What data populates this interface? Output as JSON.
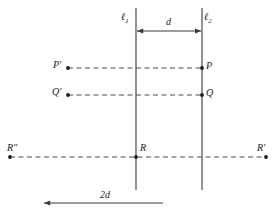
{
  "figure": {
    "width": 276,
    "height": 215,
    "background_color": "#ffffff",
    "stroke_color": "#3a3a3a",
    "dashed_color": "#4a4a4a",
    "text_color": "#1a1a1a"
  },
  "lines": {
    "l1": {
      "label": "ℓ",
      "subscript": "1",
      "x": 136,
      "y_top": 8,
      "y_bottom": 190,
      "label_x": 121,
      "label_y": 12
    },
    "l2": {
      "label": "ℓ",
      "subscript": "2",
      "x": 202,
      "y_top": 8,
      "y_bottom": 190,
      "label_x": 204,
      "label_y": 12
    }
  },
  "measures": {
    "d": {
      "label": "d",
      "x_start": 136,
      "x_end": 202,
      "y": 31,
      "label_x": 166,
      "label_y": 17
    },
    "two_d": {
      "label": "2d",
      "x_start": 43,
      "x_end": 163,
      "y": 203,
      "label_x": 100,
      "label_y": 190
    }
  },
  "points": [
    {
      "name": "P-prime",
      "label": "P′",
      "dot_x": 68,
      "dot_y": 68,
      "label_x": 53,
      "label_y": 60,
      "label_side": "left"
    },
    {
      "name": "P",
      "label": "P",
      "dot_x": 202,
      "dot_y": 68,
      "label_x": 206,
      "label_y": 61,
      "label_side": "right"
    },
    {
      "name": "Q-prime",
      "label": "Q′",
      "dot_x": 68,
      "dot_y": 95,
      "label_x": 52,
      "label_y": 87,
      "label_side": "left"
    },
    {
      "name": "Q",
      "label": "Q",
      "dot_x": 202,
      "dot_y": 95,
      "label_x": 206,
      "label_y": 88,
      "label_side": "right"
    },
    {
      "name": "R-double-prime",
      "label": "R″",
      "dot_x": 10,
      "dot_y": 157,
      "label_x": 7,
      "label_y": 143,
      "label_side": "above"
    },
    {
      "name": "R",
      "label": "R",
      "dot_x": 136,
      "dot_y": 157,
      "label_x": 140,
      "label_y": 143,
      "label_side": "above-right"
    },
    {
      "name": "R-prime",
      "label": "R′",
      "dot_x": 266,
      "dot_y": 157,
      "label_x": 257,
      "label_y": 143,
      "label_side": "above"
    }
  ],
  "dashed_segments": [
    {
      "name": "segment-P-prime-to-P",
      "x_start": 68,
      "x_end": 202,
      "y": 68
    },
    {
      "name": "segment-Q-prime-to-Q",
      "x_start": 68,
      "x_end": 202,
      "y": 95
    },
    {
      "name": "segment-R-double-prime-to-R-prime",
      "x_start": 10,
      "x_end": 266,
      "y": 157
    }
  ]
}
